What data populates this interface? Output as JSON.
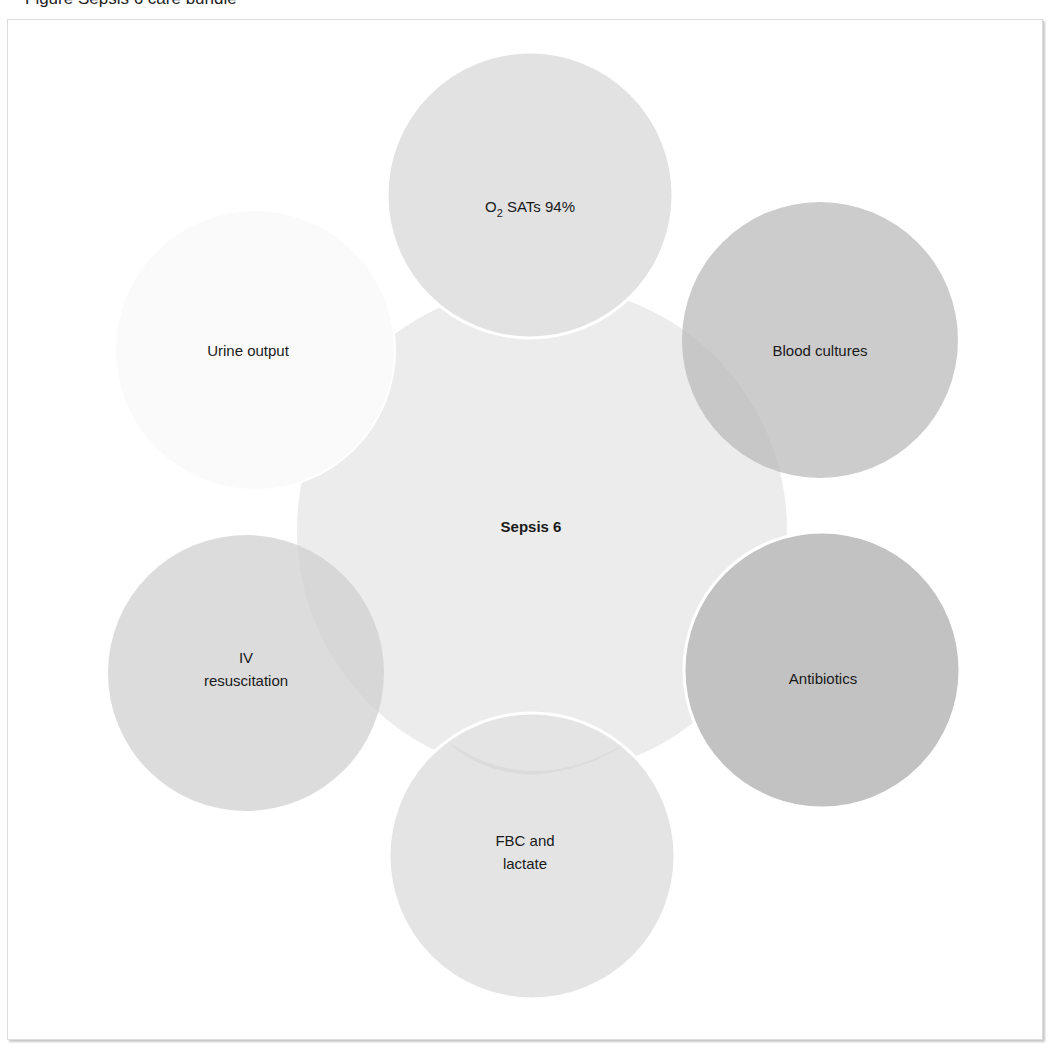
{
  "figure": {
    "title": "Figure Sepsis 6 care bundle"
  },
  "diagram": {
    "center": {
      "label": "Sepsis 6",
      "color": "#ececec"
    },
    "nodes": [
      {
        "id": "o2",
        "label_main": "O",
        "label_sub": "2",
        "label_rest": " SATs 94%",
        "color": "#e2e2e2"
      },
      {
        "id": "blood-cultures",
        "lines": [
          "Blood cultures"
        ],
        "color": "#c9c9c9"
      },
      {
        "id": "antibiotics",
        "lines": [
          "Antibiotics"
        ],
        "color": "#c2c2c2"
      },
      {
        "id": "fbc-lactate",
        "lines": [
          "FBC and",
          "lactate"
        ],
        "color": "#e5e5e5"
      },
      {
        "id": "iv-resuscitation",
        "lines": [
          "IV",
          "resuscitation"
        ],
        "color": "#dadada"
      },
      {
        "id": "urine-output",
        "lines": [
          "Urine output"
        ],
        "color": "#f9f9f9"
      }
    ]
  },
  "colors": {
    "frame_border": "#dcdcdc",
    "text": "#1a1a1a",
    "background": "#ffffff"
  }
}
